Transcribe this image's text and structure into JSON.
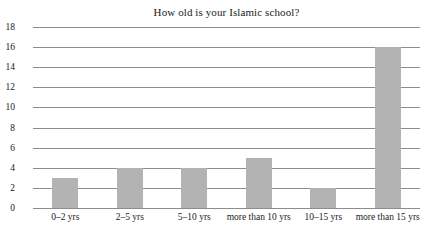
{
  "chart_data": {
    "type": "bar",
    "title": "How old is your Islamic school?",
    "xlabel": "",
    "ylabel": "",
    "categories": [
      "0–2 yrs",
      "2–5 yrs",
      "5–10 yrs",
      "more than 10 yrs",
      "10–15 yrs",
      "more than 15 yrs"
    ],
    "values": [
      3,
      4,
      4,
      5,
      2,
      16
    ],
    "ylim": [
      0,
      18
    ],
    "yticks": [
      0,
      2,
      4,
      6,
      8,
      10,
      12,
      14,
      16,
      18
    ],
    "ytick_labels": [
      "0",
      "2",
      "4",
      "6",
      "8",
      "10",
      "12",
      "14",
      "16",
      "18"
    ],
    "grid": true,
    "legend": false,
    "legend_position": "none",
    "bar_color": "#b3b3b3",
    "gridline_color": "#8d8d8d",
    "background_color": "#ffffff"
  }
}
